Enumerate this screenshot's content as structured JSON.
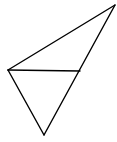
{
  "diagram": {
    "type": "geometry",
    "stroke_color": "#000000",
    "background": "#ffffff",
    "points": {
      "A": [
        115,
        5
      ],
      "B": [
        8,
        70
      ],
      "C": [
        44,
        135
      ],
      "D": [
        80,
        71
      ]
    },
    "segments": [
      [
        "A",
        "B"
      ],
      [
        "A",
        "C"
      ],
      [
        "B",
        "C"
      ],
      [
        "B",
        "D"
      ]
    ]
  }
}
